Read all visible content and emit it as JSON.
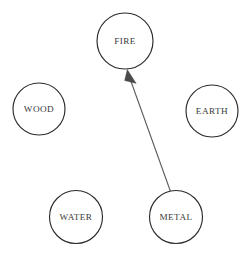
{
  "diagram": {
    "type": "directed-graph",
    "width": 243,
    "height": 253,
    "background_color": "#ffffff",
    "node_stroke_color": "#2b2b2b",
    "node_fill_color": "#ffffff",
    "label_color": "#3a3a3a",
    "edge_color": "#555555",
    "arrowhead_color": "#4a4a4a",
    "nodes": [
      {
        "id": "fire",
        "label": "FIRE",
        "cx": 125,
        "cy": 41,
        "r": 28
      },
      {
        "id": "wood",
        "label": "WOOD",
        "cx": 39,
        "cy": 109,
        "r": 26
      },
      {
        "id": "earth",
        "label": "EARTH",
        "cx": 212,
        "cy": 111,
        "r": 26
      },
      {
        "id": "water",
        "label": "WATER",
        "cx": 76,
        "cy": 217,
        "r": 26.5
      },
      {
        "id": "metal",
        "label": "METAL",
        "cx": 176,
        "cy": 217,
        "r": 26.5
      }
    ],
    "edges": [
      {
        "id": "metal-to-fire",
        "source": "metal",
        "target": "fire",
        "directed": true,
        "x1": 170.5,
        "y1": 191.5,
        "x2": 130.5,
        "y2": 80.0,
        "arrow_tip_x": 127.3,
        "arrow_tip_y": 69.5
      }
    ]
  }
}
